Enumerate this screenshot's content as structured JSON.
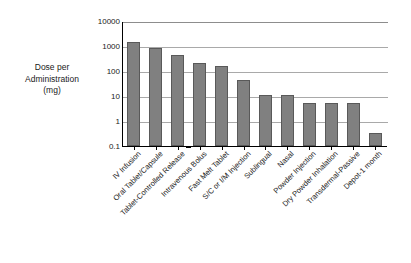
{
  "chart_data": {
    "type": "bar",
    "title": "",
    "xlabel": "",
    "ylabel": "Dose per Administration (mg)",
    "ylabel_lines": [
      "Dose per",
      "Administration",
      "(mg)"
    ],
    "scale": "log10",
    "ylim": [
      0.1,
      10000
    ],
    "ytick_labels": [
      "10000",
      "1000",
      "100",
      "10",
      "1",
      "0.1"
    ],
    "ytick_values": [
      10000,
      1000,
      100,
      10,
      1,
      0.1
    ],
    "grid": true,
    "legend": "none",
    "bar_color": "#808080",
    "bar_edge_color": "#595959",
    "axis_color": "#000000",
    "grid_color": "#a9a9a9",
    "categories": [
      "IV Infusion",
      "Oral Tablet/Capsule",
      "Tablet-Controlled Release",
      "Intravenous Bolus",
      "Fast Melt Tablet",
      "S/C or I/M Injection",
      "Sublingual",
      "Nasal",
      "Powder Injection",
      "Dry Powder Inhalation",
      "Transdermal-Passive",
      "Depot-1 month"
    ],
    "values": [
      1450,
      850,
      430,
      200,
      160,
      44,
      11,
      11,
      5.5,
      5.5,
      5.5,
      0.33
    ]
  }
}
